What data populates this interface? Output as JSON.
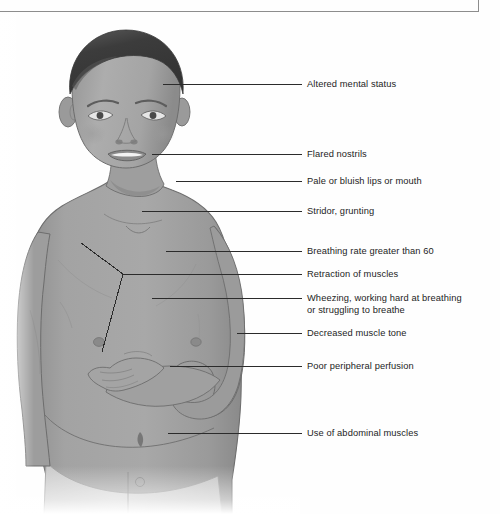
{
  "page": {
    "background_color": "#fefefe",
    "frame_color": "#8d8d8d",
    "label_text_color": "#1d1d1d",
    "leader_line_color": "#2b2b2b"
  },
  "figure": {
    "style": "grayscale medical illustration",
    "skin_color": "#a2a2a2",
    "skin_shadow_color": "#8f8f8f",
    "hair_color": "#3f3f3f",
    "outline_color": "#6a6a6a"
  },
  "callouts": [
    {
      "id": "altered-mental-status",
      "label": "Altered mental status",
      "label_x": 307,
      "label_y": 78,
      "leader_x": 163,
      "leader_y": 84,
      "leader_w": 139
    },
    {
      "id": "flared-nostrils",
      "label": "Flared nostrils",
      "label_x": 307,
      "label_y": 148,
      "leader_x": 152,
      "leader_y": 154,
      "leader_w": 150
    },
    {
      "id": "pale-or-bluish-lips-or-mouth",
      "label": "Pale or bluish lips or mouth",
      "label_x": 307,
      "label_y": 175,
      "leader_x": 176,
      "leader_y": 181,
      "leader_w": 126
    },
    {
      "id": "stridor-grunting",
      "label": "Stridor, grunting",
      "label_x": 307,
      "label_y": 205,
      "leader_x": 142,
      "leader_y": 211,
      "leader_w": 160
    },
    {
      "id": "breathing-rate-greater-than-60",
      "label": "Breathing rate greater than 60",
      "label_x": 307,
      "label_y": 245,
      "leader_x": 166,
      "leader_y": 251,
      "leader_w": 136
    },
    {
      "id": "retraction-of-muscles",
      "label": "Retraction of muscles",
      "label_x": 307,
      "label_y": 268,
      "leader_x": 123,
      "leader_y": 274,
      "leader_w": 179
    },
    {
      "id": "wheezing-working-hard-at-breathing",
      "label": "Wheezing, working hard at breathing\nor struggling to breathe",
      "label_x": 307,
      "label_y": 292,
      "leader_x": 152,
      "leader_y": 298,
      "leader_w": 150
    },
    {
      "id": "decreased-muscle-tone",
      "label": "Decreased muscle tone",
      "label_x": 307,
      "label_y": 327,
      "leader_x": 237,
      "leader_y": 333,
      "leader_w": 65
    },
    {
      "id": "poor-peripheral-perfusion",
      "label": "Poor peripheral perfusion",
      "label_x": 307,
      "label_y": 360,
      "leader_x": 170,
      "leader_y": 366,
      "leader_w": 132
    },
    {
      "id": "use-of-abdominal-muscles",
      "label": "Use of abdominal muscles",
      "label_x": 307,
      "label_y": 427,
      "leader_x": 168,
      "leader_y": 433,
      "leader_w": 134
    }
  ]
}
